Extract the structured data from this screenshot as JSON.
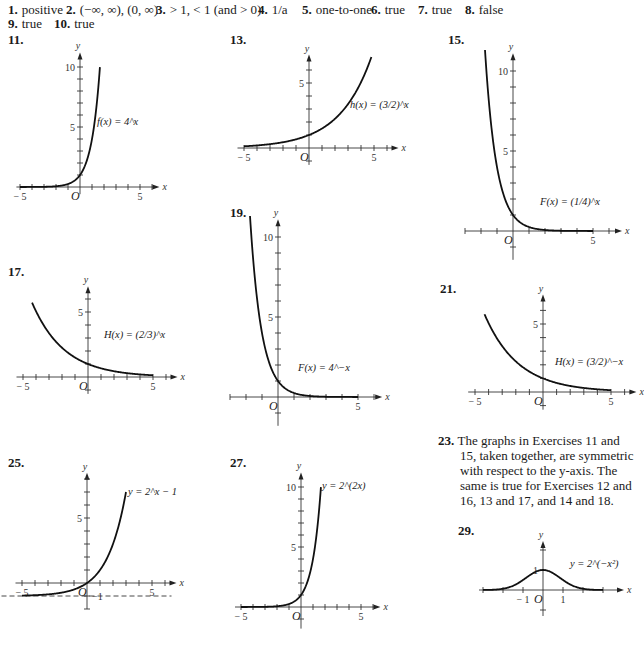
{
  "answers": {
    "row1": [
      {
        "n": "1.",
        "text": "positive",
        "x": 8
      },
      {
        "n": "2.",
        "text": "(−∞, ∞), (0, ∞)",
        "x": 66
      },
      {
        "n": "3.",
        "text": "> 1, < 1 (and > 0)",
        "x": 156
      },
      {
        "n": "4.",
        "text": "1/a",
        "x": 258
      },
      {
        "n": "5.",
        "text": "one-to-one",
        "x": 302
      },
      {
        "n": "6.",
        "text": "true",
        "x": 371
      },
      {
        "n": "7.",
        "text": "true",
        "x": 418
      },
      {
        "n": "8.",
        "text": "false",
        "x": 465
      }
    ],
    "row2": [
      {
        "n": "9.",
        "text": "true",
        "x": 8
      },
      {
        "n": "10.",
        "text": "true",
        "x": 54
      }
    ]
  },
  "note": {
    "number": "23.",
    "text": "The graphs in Exercises 11 and 15, taken together, are symmetric with respect to the y-axis. The same is true for Exercises 12 and 16, 13 and 17, and 14 and 18."
  },
  "chart_data": [
    {
      "id": "11",
      "type": "line",
      "title": "11.",
      "label": "f(x) = 4^x",
      "func": "4^x",
      "xlabel": "x",
      "ylabel": "y",
      "xlim": [
        -5.3,
        6.2
      ],
      "ylim": [
        -0.6,
        10.8
      ],
      "x_ticks": [
        -5,
        5
      ],
      "y_ticks": [
        5,
        10
      ],
      "grid": false,
      "origin_px": [
        80,
        187
      ],
      "scale_px": [
        12,
        12
      ],
      "num_pos": [
        8,
        32
      ],
      "label_pos": [
        97,
        125
      ],
      "points": [
        [
          -5,
          0.001
        ],
        [
          -3,
          0.016
        ],
        [
          -2,
          0.0625
        ],
        [
          -1,
          0.25
        ],
        [
          0,
          1
        ],
        [
          0.5,
          2
        ],
        [
          1,
          4
        ],
        [
          1.5,
          8
        ],
        [
          1.66,
          10
        ]
      ]
    },
    {
      "id": "13",
      "type": "line",
      "title": "13.",
      "label": "h(x) = (3/2)^x",
      "func": "(3/2)^x",
      "xlabel": "x",
      "ylabel": "y",
      "xlim": [
        -5.5,
        6.5
      ],
      "ylim": [
        -1.3,
        6.8
      ],
      "x_ticks": [
        -5,
        5
      ],
      "y_ticks": [
        5
      ],
      "grid": false,
      "origin_px": [
        309,
        148
      ],
      "scale_px": [
        13,
        13
      ],
      "num_pos": [
        230,
        32
      ],
      "label_pos": [
        350,
        108
      ],
      "points": [
        [
          -5,
          0.13
        ],
        [
          -3,
          0.3
        ],
        [
          -1,
          0.67
        ],
        [
          0,
          1
        ],
        [
          1,
          1.5
        ],
        [
          2,
          2.25
        ],
        [
          3,
          3.375
        ],
        [
          4,
          5.06
        ],
        [
          4.8,
          7.0
        ]
      ]
    },
    {
      "id": "15",
      "type": "line",
      "title": "15.",
      "label": "F(x) = (1/4)^x",
      "func": "(1/4)^x",
      "xlabel": "x",
      "ylabel": "y",
      "xlim": [
        -3,
        6.5
      ],
      "ylim": [
        -1.8,
        10.8
      ],
      "x_ticks": [
        5
      ],
      "y_ticks": [
        5,
        10
      ],
      "grid": false,
      "origin_px": [
        513,
        231
      ],
      "scale_px": [
        16,
        16
      ],
      "num_pos": [
        448,
        32
      ],
      "label_pos": [
        540,
        205
      ],
      "points": [
        [
          -1.75,
          11.3
        ],
        [
          -1.5,
          8
        ],
        [
          -1,
          4
        ],
        [
          -0.5,
          2
        ],
        [
          0,
          1
        ],
        [
          1,
          0.25
        ],
        [
          2,
          0.0625
        ],
        [
          3,
          0.016
        ],
        [
          5,
          0.001
        ]
      ]
    },
    {
      "id": "17",
      "type": "line",
      "title": "17.",
      "label": "H(x) = (2/3)^x",
      "func": "(2/3)^x",
      "xlabel": "x",
      "ylabel": "y",
      "xlim": [
        -5.5,
        6.5
      ],
      "ylim": [
        -1.3,
        6.6
      ],
      "x_ticks": [
        -5,
        5
      ],
      "y_ticks": [
        5
      ],
      "grid": false,
      "origin_px": [
        88,
        377
      ],
      "scale_px": [
        13,
        13
      ],
      "num_pos": [
        8,
        264
      ],
      "label_pos": [
        104,
        338
      ],
      "points": [
        [
          -4.3,
          5.7
        ],
        [
          -3,
          3.375
        ],
        [
          -2,
          2.25
        ],
        [
          -1,
          1.5
        ],
        [
          0,
          1
        ],
        [
          1,
          0.67
        ],
        [
          3,
          0.3
        ],
        [
          5,
          0.13
        ]
      ]
    },
    {
      "id": "19",
      "type": "line",
      "title": "19.",
      "label": "F(x) = 4^−x",
      "func": "4^(-x)",
      "xlabel": "x",
      "ylabel": "y",
      "xlim": [
        -3,
        6.2
      ],
      "ylim": [
        -1.8,
        10.8
      ],
      "x_ticks": [
        5
      ],
      "y_ticks": [
        5,
        10
      ],
      "grid": false,
      "origin_px": [
        278,
        397
      ],
      "scale_px": [
        16,
        16
      ],
      "num_pos": [
        230,
        205
      ],
      "label_pos": [
        298,
        371
      ],
      "points": [
        [
          -1.75,
          11.3
        ],
        [
          -1.5,
          8
        ],
        [
          -1,
          4
        ],
        [
          -0.5,
          2
        ],
        [
          0,
          1
        ],
        [
          1,
          0.25
        ],
        [
          2,
          0.0625
        ],
        [
          3,
          0.016
        ],
        [
          5,
          0.001
        ]
      ]
    },
    {
      "id": "21",
      "type": "line",
      "title": "21.",
      "label": "H(x) = (3/2)^−x",
      "func": "(3/2)^(-x)",
      "xlabel": "x",
      "ylabel": "y",
      "xlim": [
        -5.5,
        6.5
      ],
      "ylim": [
        -1.3,
        6.8
      ],
      "x_ticks": [
        -5,
        5
      ],
      "y_ticks": [
        5
      ],
      "grid": false,
      "origin_px": [
        543,
        392
      ],
      "scale_px": [
        13.6,
        13.6
      ],
      "num_pos": [
        440,
        281
      ],
      "label_pos": [
        555,
        365
      ],
      "points": [
        [
          -4.3,
          5.7
        ],
        [
          -3,
          3.375
        ],
        [
          -2,
          2.25
        ],
        [
          -1,
          1.5
        ],
        [
          0,
          1
        ],
        [
          1,
          0.67
        ],
        [
          3,
          0.3
        ],
        [
          5,
          0.13
        ]
      ]
    },
    {
      "id": "25",
      "type": "line",
      "title": "25.",
      "label": "y = 2^x − 1",
      "func": "2^x - 1",
      "xlabel": "x",
      "ylabel": "y",
      "xlim": [
        -5.5,
        6.5
      ],
      "ylim": [
        -2,
        8.1
      ],
      "x_ticks": [
        -5,
        5
      ],
      "y_ticks": [
        5,
        -1
      ],
      "asymptote": -1,
      "grid": false,
      "origin_px": [
        87,
        583
      ],
      "scale_px": [
        13,
        13
      ],
      "num_pos": [
        8,
        455
      ],
      "label_pos": [
        128,
        495
      ],
      "points": [
        [
          -5,
          -0.97
        ],
        [
          -3,
          -0.875
        ],
        [
          -2,
          -0.75
        ],
        [
          -1,
          -0.5
        ],
        [
          0,
          0
        ],
        [
          1,
          1
        ],
        [
          2,
          3
        ],
        [
          2.6,
          5.06
        ],
        [
          3,
          7
        ]
      ]
    },
    {
      "id": "27",
      "type": "line",
      "title": "27.",
      "label": "y = 2^(2x)",
      "func": "2^(2x)",
      "xlabel": "x",
      "ylabel": "y",
      "xlim": [
        -5.5,
        6.2
      ],
      "ylim": [
        -1.8,
        10.8
      ],
      "x_ticks": [
        -5,
        5
      ],
      "y_ticks": [
        5,
        10
      ],
      "grid": false,
      "origin_px": [
        301,
        607
      ],
      "scale_px": [
        12,
        12
      ],
      "num_pos": [
        230,
        455
      ],
      "label_pos": [
        322,
        489
      ],
      "points": [
        [
          -5,
          0.001
        ],
        [
          -2,
          0.0625
        ],
        [
          -1,
          0.25
        ],
        [
          0,
          1
        ],
        [
          0.5,
          2
        ],
        [
          1,
          4
        ],
        [
          1.5,
          8
        ],
        [
          1.66,
          10
        ]
      ]
    },
    {
      "id": "29",
      "type": "line",
      "title": "29.",
      "label": "y = 2^(−x²)",
      "func": "2^(-x^2)",
      "xlabel": "x",
      "ylabel": "y",
      "xlim": [
        -3.2,
        3.8
      ],
      "ylim": [
        -1.3,
        2.2
      ],
      "x_ticks": [
        -1,
        1
      ],
      "y_ticks": [
        1
      ],
      "grid": false,
      "origin_px": [
        543,
        590
      ],
      "scale_px": [
        20,
        20
      ],
      "num_pos": [
        458,
        523
      ],
      "label_pos": [
        570,
        567
      ],
      "points": [
        [
          -3,
          0.002
        ],
        [
          -2,
          0.0625
        ],
        [
          -1.5,
          0.21
        ],
        [
          -1,
          0.5
        ],
        [
          -0.5,
          0.84
        ],
        [
          0,
          1
        ],
        [
          0.5,
          0.84
        ],
        [
          1,
          0.5
        ],
        [
          1.5,
          0.21
        ],
        [
          2,
          0.0625
        ],
        [
          3,
          0.002
        ]
      ]
    }
  ]
}
